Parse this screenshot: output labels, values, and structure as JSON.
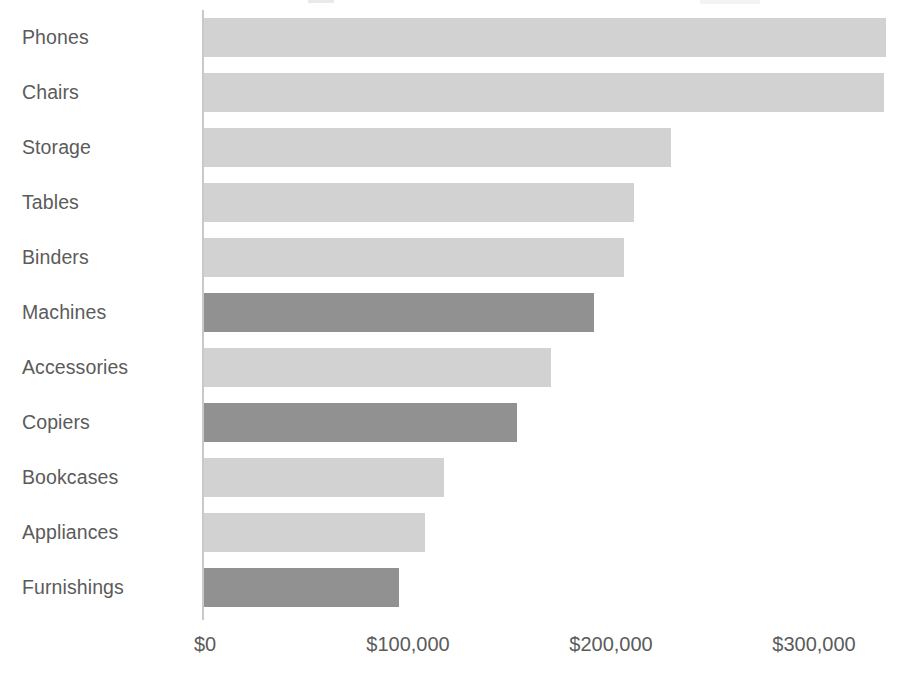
{
  "chart_data": {
    "type": "bar",
    "orientation": "horizontal",
    "title": "",
    "xlabel": "",
    "ylabel": "",
    "categories": [
      "Phones",
      "Chairs",
      "Storage",
      "Tables",
      "Binders",
      "Machines",
      "Accessories",
      "Copiers",
      "Bookcases",
      "Appliances",
      "Furnishings"
    ],
    "values": [
      336000,
      335000,
      230000,
      212000,
      207000,
      192000,
      171000,
      154000,
      118000,
      109000,
      96000
    ],
    "bar_colors": [
      "light",
      "light",
      "light",
      "light",
      "light",
      "dark",
      "light",
      "dark",
      "light",
      "light",
      "dark"
    ],
    "xlim": [
      0,
      344000
    ],
    "xticks": [
      0,
      100000,
      200000,
      300000
    ],
    "xtick_labels": [
      "$0",
      "$100,000",
      "$200,000",
      "$300,000"
    ],
    "grid": false,
    "legend": "none",
    "colors": {
      "bar_light": "#d2d2d2",
      "bar_dark": "#919191",
      "text": "#5b5b5b",
      "axis": "#c9c9c9",
      "background": "#ffffff"
    }
  },
  "axis": {
    "ticks": [
      {
        "label": "$0",
        "value": 0
      },
      {
        "label": "$100,000",
        "value": 100000
      },
      {
        "label": "$200,000",
        "value": 200000
      },
      {
        "label": "$300,000",
        "value": 300000
      }
    ]
  },
  "bars": [
    {
      "label": "Phones",
      "value": 336000,
      "shade": "light"
    },
    {
      "label": "Chairs",
      "value": 335000,
      "shade": "light"
    },
    {
      "label": "Storage",
      "value": 230000,
      "shade": "light"
    },
    {
      "label": "Tables",
      "value": 212000,
      "shade": "light"
    },
    {
      "label": "Binders",
      "value": 207000,
      "shade": "light"
    },
    {
      "label": "Machines",
      "value": 192000,
      "shade": "dark"
    },
    {
      "label": "Accessories",
      "value": 171000,
      "shade": "light"
    },
    {
      "label": "Copiers",
      "value": 154000,
      "shade": "dark"
    },
    {
      "label": "Bookcases",
      "value": 118000,
      "shade": "light"
    },
    {
      "label": "Appliances",
      "value": 109000,
      "shade": "light"
    },
    {
      "label": "Furnishings",
      "value": 96000,
      "shade": "dark"
    }
  ]
}
